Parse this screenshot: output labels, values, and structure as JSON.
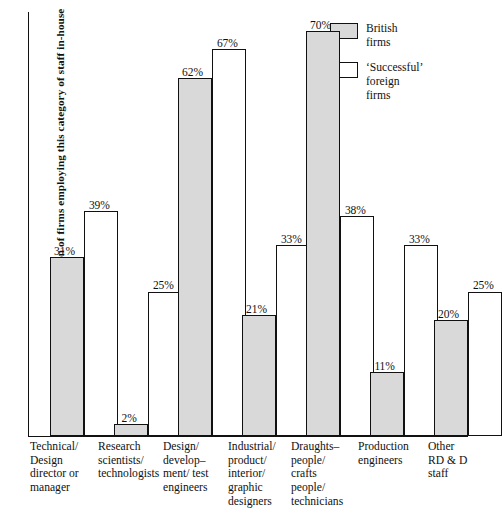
{
  "chart_data": {
    "type": "bar",
    "title": "",
    "xlabel": "",
    "ylabel": "Proportion of firms employing this category of staff in-house",
    "ylim": [
      0,
      75
    ],
    "grid": false,
    "legend_position": "top-right",
    "value_suffix": "%",
    "categories": [
      "Technical/ Design director or manager",
      "Research scientists/ technologists",
      "Design/ develop- ment/ test engineers",
      "Industrial/ product/ interior/ graphic designers",
      "Draughts- people/ crafts people/ technicians",
      "Production engineers",
      "Other RD & D staff"
    ],
    "category_lines": [
      [
        "Technical/",
        "Design",
        "director or",
        "manager"
      ],
      [
        "Research",
        "scientists/",
        "technologists"
      ],
      [
        "Design/",
        "develop–",
        "ment/ test",
        "engineers"
      ],
      [
        "Industrial/",
        "product/",
        "interior/",
        "graphic",
        "designers"
      ],
      [
        "Draughts–",
        "people/",
        "crafts",
        "people/",
        "technicians"
      ],
      [
        "Production",
        "engineers"
      ],
      [
        "Other",
        "RD & D",
        "staff"
      ]
    ],
    "series": [
      {
        "name": "British firms",
        "legend_lines": [
          "British",
          "firms"
        ],
        "color": "#d9d9d9",
        "values": [
          31,
          2,
          62,
          21,
          70,
          11,
          20
        ],
        "labels": [
          "31%",
          "2%",
          "62%",
          "21%",
          "70%",
          "11%",
          "20%"
        ]
      },
      {
        "name": "'Successful' foreign firms",
        "legend_lines": [
          "‘Successful’",
          "foreign",
          "firms"
        ],
        "color": "#ffffff",
        "values": [
          39,
          25,
          67,
          33,
          38,
          33,
          25
        ],
        "labels": [
          "39%",
          "25%",
          "67%",
          "33%",
          "38%",
          "33%",
          "25%"
        ]
      }
    ]
  },
  "layout": {
    "plot_width": 440,
    "plot_height": 425,
    "px_per_percent": 5.78,
    "bar_width": 34,
    "group_starts": [
      22,
      86,
      150,
      214,
      278,
      342,
      406
    ],
    "bar_gap": 0,
    "cat_lefts": [
      2,
      70,
      135,
      200,
      263,
      330,
      400
    ],
    "cat_widths": [
      70,
      68,
      70,
      70,
      72,
      72,
      72
    ]
  }
}
